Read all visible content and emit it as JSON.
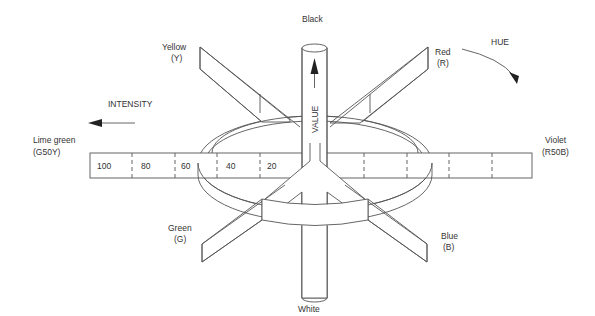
{
  "diagram": {
    "type": "Munsell-style color solid",
    "labels": {
      "top": "Black",
      "bottom": "White",
      "axis": "VALUE",
      "intensity": "INTENSITY",
      "hue": "HUE"
    },
    "hues": {
      "yellow": {
        "name": "Yellow",
        "code": "(Y)"
      },
      "red": {
        "name": "Red",
        "code": "(R)"
      },
      "green": {
        "name": "Green",
        "code": "(G)"
      },
      "blue": {
        "name": "Blue",
        "code": "(B)"
      },
      "lime": {
        "name": "Lime green",
        "code": "(G50Y)"
      },
      "violet": {
        "name": "Violet",
        "code": "(R50B)"
      }
    },
    "intensity_scale": [
      "100",
      "80",
      "60",
      "40",
      "20"
    ],
    "colors": {
      "line": "#555555",
      "text": "#333333",
      "background": "#ffffff"
    }
  }
}
